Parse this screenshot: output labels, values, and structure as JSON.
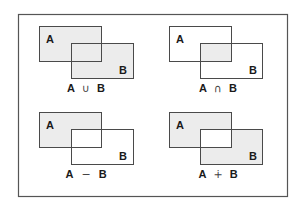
{
  "diagram": {
    "colors": {
      "frame": "#555555",
      "stroke": "#4a4a4a",
      "fill": "#ececec",
      "background": "#ffffff",
      "text": "#1a1a1a"
    },
    "panels": [
      {
        "id": "union",
        "set_a": "A",
        "set_b": "B",
        "left": "A",
        "operator": "∪",
        "right": "B",
        "caption": "A ∪ B",
        "shaded": [
          "a_only",
          "overlap",
          "b_only"
        ]
      },
      {
        "id": "intersection",
        "set_a": "A",
        "set_b": "B",
        "left": "A",
        "operator": "∩",
        "right": "B",
        "caption": "A ∩ B",
        "shaded": [
          "overlap"
        ]
      },
      {
        "id": "difference",
        "set_a": "A",
        "set_b": "B",
        "left": "A",
        "operator": "−",
        "right": "B",
        "caption": "A − B",
        "shaded": [
          "a_only"
        ]
      },
      {
        "id": "symmetric-difference",
        "set_a": "A",
        "set_b": "B",
        "left": "A",
        "operator": "∔",
        "right": "B",
        "caption": "A ∔ B",
        "shaded": [
          "a_only",
          "b_only"
        ]
      }
    ]
  }
}
